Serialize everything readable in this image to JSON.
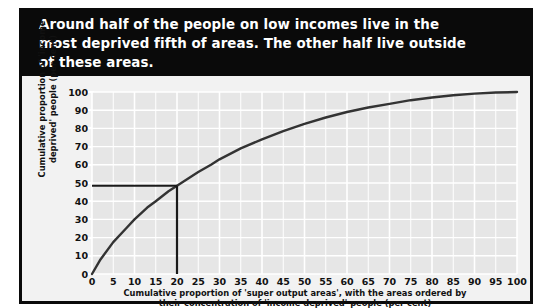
{
  "title": "Around half of the people on low incomes live in the\nmost deprived fifth of areas.  The other half live outside\nof these areas.",
  "colors": {
    "banner_background": "#0a0a0a",
    "banner_text": "#ffffff",
    "figure_background": "#f2f2f2",
    "plot_background": "#e6e6e6",
    "gridline": "#ffffff",
    "curve": "#333333",
    "reference_line": "#1a1a1a",
    "tick_text": "#111111"
  },
  "chart_data": {
    "type": "line",
    "title": "Around half of the people on low incomes live in the most deprived fifth of areas.  The other half live outside of these areas.",
    "xlabel": "Cumulative proportion of 'super output areas', with the areas ordered by\ntheir concentration of 'income deprived' people (per cent)",
    "ylabel": "Cumulative proportion of 'income\ndeprived' people (per cent)",
    "xlim": [
      0,
      100
    ],
    "ylim": [
      0,
      100
    ],
    "xticks": [
      0,
      5,
      10,
      15,
      20,
      25,
      30,
      35,
      40,
      45,
      50,
      55,
      60,
      65,
      70,
      75,
      80,
      85,
      90,
      95,
      100
    ],
    "yticks": [
      0,
      10,
      20,
      30,
      40,
      50,
      60,
      70,
      80,
      90,
      100
    ],
    "grid": true,
    "legend": "none",
    "series": [
      {
        "name": "Lorenz curve of 'income deprived' people by area",
        "x": [
          0,
          2,
          5,
          8,
          10,
          13,
          15,
          18,
          20,
          23,
          25,
          28,
          30,
          35,
          40,
          45,
          50,
          55,
          60,
          65,
          70,
          75,
          80,
          85,
          90,
          95,
          100
        ],
        "y": [
          0,
          8,
          17.5,
          25,
          30,
          36.5,
          40,
          45.5,
          48.5,
          53,
          56,
          60,
          63,
          69,
          74,
          78.5,
          82.5,
          86,
          89,
          91.5,
          93.5,
          95.5,
          97,
          98.2,
          99.1,
          99.7,
          100
        ]
      }
    ],
    "annotations": [
      {
        "name": "reference-lines",
        "description": "Horizontal line from y-axis to curve at y=48.5 and vertical line from curve down to x-axis at x=20",
        "x": 20,
        "y": 48.5
      }
    ]
  },
  "axes": {
    "x_tick_labels": [
      "0",
      "5",
      "10",
      "15",
      "20",
      "25",
      "30",
      "35",
      "40",
      "45",
      "50",
      "55",
      "60",
      "65",
      "70",
      "75",
      "80",
      "85",
      "90",
      "95",
      "100"
    ],
    "y_tick_labels": [
      "100",
      "90",
      "80",
      "70",
      "60",
      "50",
      "40",
      "30",
      "20",
      "10",
      "0"
    ],
    "x_title": "Cumulative proportion of 'super output areas', with the areas ordered by\ntheir concentration of 'income deprived' people (per cent)",
    "y_title": "Cumulative proportion of 'income\ndeprived' people (per cent)"
  }
}
